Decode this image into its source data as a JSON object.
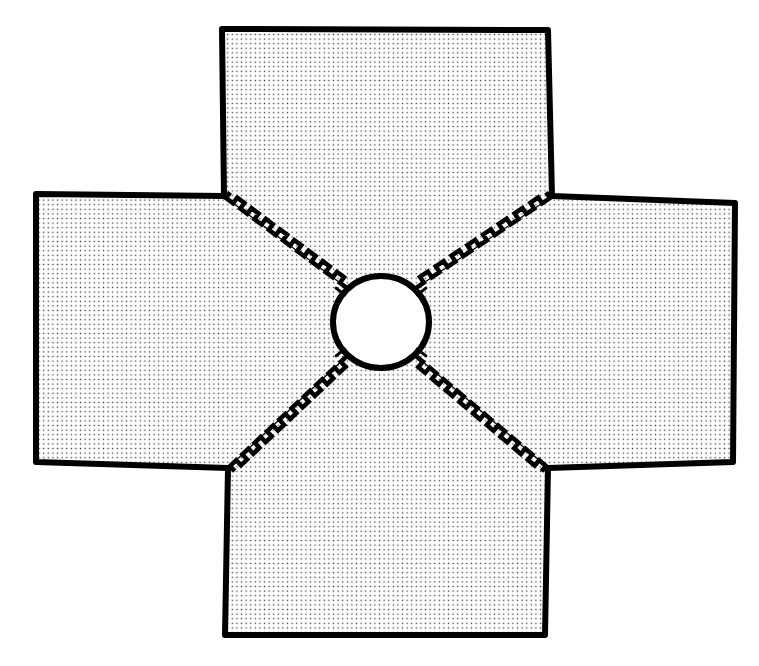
{
  "figure": {
    "kind": "technical-line-drawing",
    "canvas": {
      "width": 759,
      "height": 666,
      "background": "#ffffff"
    },
    "colors": {
      "outline": "#000000",
      "fill_background": "#ffffff",
      "stipple_dot": "#1a1a1a",
      "crack_thin_line": "#000000",
      "crack_zigzag": "#000000"
    },
    "stroke_widths": {
      "outer_outline": 6,
      "hole_outline": 6,
      "crack_zigzag": 4.5,
      "crack_thin_line": 1.2,
      "notch_tab": 3
    },
    "stipple": {
      "pattern": "square-dot-grid",
      "spacing": 4.6,
      "dot_size": 1.35,
      "opacity": 0.85
    },
    "outer_outline_points": "222,29 548,30 552,196 735,203 733,462 548,468 545,635 225,635 228,468 36,462 36,194 224,196",
    "hole": {
      "center_x": 381,
      "center_y": 322,
      "radius_x": 48,
      "radius_y": 46,
      "label": "central-circular-hole"
    },
    "reentrant_corners": [
      {
        "name": "corner-top-left",
        "x": 224,
        "y": 196
      },
      {
        "name": "corner-top-right",
        "x": 552,
        "y": 196
      },
      {
        "name": "corner-bottom-right",
        "x": 548,
        "y": 468
      },
      {
        "name": "corner-bottom-left",
        "x": 228,
        "y": 468
      }
    ],
    "cracks": [
      {
        "name": "crack-upper-left",
        "from_x": 347,
        "from_y": 288,
        "to_x": 226,
        "to_y": 198,
        "zigzag_side": 1,
        "teeth": 17,
        "amplitude": 7
      },
      {
        "name": "crack-upper-right",
        "from_x": 416,
        "from_y": 288,
        "to_x": 550,
        "to_y": 198,
        "zigzag_side": -1,
        "teeth": 17,
        "amplitude": 7
      },
      {
        "name": "crack-lower-right",
        "from_x": 416,
        "from_y": 356,
        "to_x": 546,
        "to_y": 466,
        "zigzag_side": 1,
        "teeth": 19,
        "amplitude": 7
      },
      {
        "name": "crack-lower-left",
        "from_x": 347,
        "from_y": 356,
        "to_x": 230,
        "to_y": 466,
        "zigzag_side": -1,
        "teeth": 19,
        "amplitude": 7
      }
    ],
    "hole_notches": [
      {
        "name": "notch-upper-left",
        "angle_deg": 218
      },
      {
        "name": "notch-upper-right",
        "angle_deg": 322
      },
      {
        "name": "notch-lower-right",
        "angle_deg": 38
      },
      {
        "name": "notch-lower-left",
        "angle_deg": 142
      }
    ],
    "arms": [
      {
        "name": "arm-top",
        "orientation": "north"
      },
      {
        "name": "arm-right",
        "orientation": "east"
      },
      {
        "name": "arm-bottom",
        "orientation": "south"
      },
      {
        "name": "arm-left",
        "orientation": "west"
      }
    ]
  }
}
